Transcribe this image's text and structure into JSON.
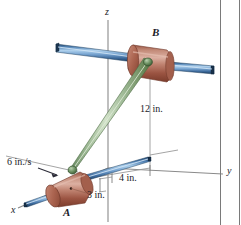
{
  "figure": {
    "background_color": "#ffffff",
    "border_color": "#7a7a7a",
    "axes": {
      "z_label": "z",
      "y_label": "y",
      "x_label": "x",
      "axis_line_color": "#8a8a8a"
    },
    "points": [
      {
        "name": "point-label-a",
        "label": "A"
      },
      {
        "name": "point-label-b",
        "label": "B"
      }
    ],
    "dimensions": [
      {
        "name": "dimension-12in",
        "label": "12 in."
      },
      {
        "name": "dimension-4in",
        "label": "4 in."
      },
      {
        "name": "dimension-3in",
        "label": "3 in."
      }
    ],
    "velocity": {
      "label": "6 in./s",
      "arrow_color": "#2c2c38"
    },
    "colors": {
      "rod_blue_light": "#9dc4e6",
      "rod_blue_mid": "#5b8fc4",
      "rod_blue_dark": "#2f5d8c",
      "rod_blue_edge": "#1d3c5c",
      "collar_light": "#d9a99a",
      "collar_mid": "#b5705c",
      "collar_dark": "#8d4c3c",
      "collar_edge": "#6d3628",
      "link_green_light": "#cfe0c4",
      "link_green_mid": "#93b18a",
      "link_green_dark": "#5f8158",
      "pin_green": "#4f7a4a",
      "axis_gray": "#8a8a8a",
      "text_dark": "#1b1b28"
    }
  }
}
